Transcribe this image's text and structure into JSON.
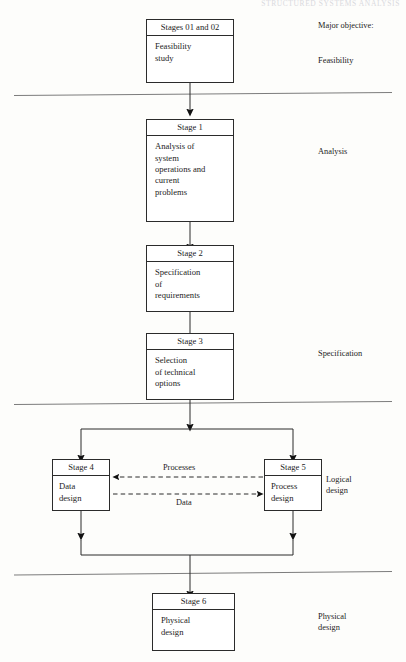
{
  "page": {
    "running_header": "STRUCTURED SYSTEMS ANALYSIS",
    "background_color": "#fdfdfb",
    "line_color": "#2b2b2b"
  },
  "diagram": {
    "type": "flowchart",
    "nodes": [
      {
        "id": "n0",
        "title": "Stages 01 and 02",
        "body": "Feasibility\nstudy"
      },
      {
        "id": "n1",
        "title": "Stage 1",
        "body": "Analysis of\nsystem\noperations and\ncurrent\nproblems"
      },
      {
        "id": "n2",
        "title": "Stage 2",
        "body": "Specification\nof\nrequirements"
      },
      {
        "id": "n3",
        "title": "Stage 3",
        "body": "Selection\nof technical\noptions"
      },
      {
        "id": "n4",
        "title": "Stage 4",
        "body": "Data\ndesign"
      },
      {
        "id": "n5",
        "title": "Stage 5",
        "body": "Process\ndesign"
      },
      {
        "id": "n6",
        "title": "Stage 6",
        "body": "Physical\ndesign"
      }
    ],
    "edge_labels": [
      {
        "id": "e_processes",
        "text": "Processes"
      },
      {
        "id": "e_data",
        "text": "Data"
      }
    ],
    "right_column": {
      "heading": "Major objective:",
      "labels": [
        {
          "id": "r_feasibility",
          "text": "Feasibility"
        },
        {
          "id": "r_analysis",
          "text": "Analysis"
        },
        {
          "id": "r_specification",
          "text": "Specification"
        },
        {
          "id": "r_logical",
          "text": "Logical\ndesign"
        },
        {
          "id": "r_physical",
          "text": "Physical\ndesign"
        }
      ]
    }
  }
}
